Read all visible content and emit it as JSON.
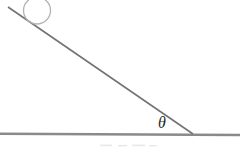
{
  "figure": {
    "type": "physics-incline-diagram",
    "background_color": "#ffffff",
    "angle": {
      "label": "θ",
      "label_x": 158,
      "label_y": 127.5,
      "label_color": "#1f1f1f"
    },
    "incline_line": {
      "x1": 8,
      "y1": 7,
      "x2": 193,
      "y2": 134,
      "color": "#737373",
      "stroke_width": 1.6
    },
    "ground_line": {
      "x1": 0,
      "y1": 133.8,
      "x2": 240,
      "y2": 135,
      "color": "#8a8a8a",
      "stroke_width": 2.4
    },
    "ball": {
      "cx": 37,
      "cy": 10.5,
      "r": 13.5,
      "outline_color": "#b3b3b3",
      "stroke_width": 1.3
    },
    "artifact": {
      "color": "#bfbfbf"
    }
  }
}
